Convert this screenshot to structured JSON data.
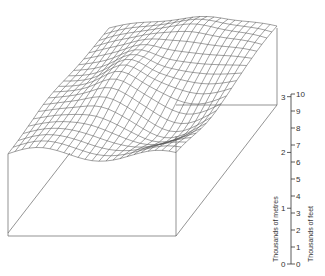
{
  "diagram": {
    "type": "3d-block-diagram",
    "colors": {
      "line": "#666666",
      "dark_line": "#333333",
      "background": "#ffffff"
    }
  },
  "scale": {
    "left_title": "Thousands of metres",
    "right_title": "Thousands of feet",
    "metres_ticks": [
      "0",
      "1",
      "2",
      "3"
    ],
    "feet_ticks": [
      "0",
      "1",
      "2",
      "3",
      "4",
      "5",
      "6",
      "7",
      "8",
      "9",
      "10"
    ]
  },
  "chart_data": {
    "type": "surface",
    "title": "",
    "axes": {
      "vertical_left": {
        "label": "Thousands of metres",
        "range": [
          0,
          3
        ],
        "ticks": [
          0,
          1,
          2,
          3
        ]
      },
      "vertical_right": {
        "label": "Thousands of feet",
        "range": [
          0,
          10
        ],
        "ticks": [
          0,
          1,
          2,
          3,
          4,
          5,
          6,
          7,
          8,
          9,
          10
        ]
      }
    },
    "grid": true,
    "legend": null
  }
}
